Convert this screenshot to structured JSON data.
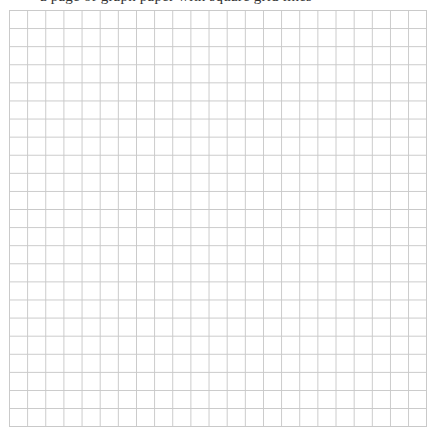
{
  "page": {
    "clipped_caption": "a page of graph paper with square grid lines"
  },
  "grid": {
    "columns": 23,
    "rows": 23,
    "line_color": "#c9c9c9",
    "background_color": "#ffffff",
    "cell_size_px": 18
  }
}
